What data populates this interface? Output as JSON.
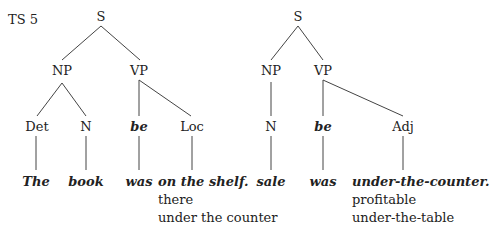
{
  "label": "TS 5",
  "tree1": {
    "S": "S",
    "NP": "NP",
    "VP": "VP",
    "Det": "Det",
    "N": "N",
    "be": "be",
    "Loc": "Loc",
    "words": [
      "The",
      "book",
      "was",
      "on the shelf."
    ],
    "alternatives": [
      "there",
      "under the counter"
    ]
  },
  "tree2": {
    "S": "S",
    "NP": "NP",
    "VP": "VP",
    "N": "N",
    "be": "be",
    "Adj": "Adj",
    "words": [
      "sale",
      "was",
      "under-the-counter."
    ],
    "alternatives": [
      "profitable",
      "under-the-table"
    ]
  }
}
